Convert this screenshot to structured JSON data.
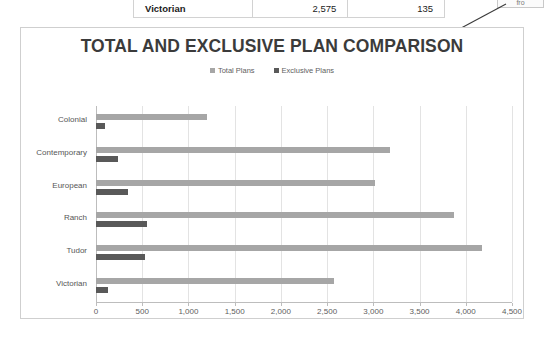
{
  "top_table": {
    "row": {
      "name": "Victorian",
      "total": "2,575",
      "exclusive": "135"
    }
  },
  "callout": {
    "text": "fro"
  },
  "chart_data": {
    "type": "bar",
    "orientation": "horizontal",
    "title": "TOTAL AND EXCLUSIVE PLAN COMPARISON",
    "xlabel": "",
    "ylabel": "",
    "xlim": [
      0,
      4500
    ],
    "xticks": [
      "0",
      "500",
      "1,000",
      "1,500",
      "2,000",
      "2,500",
      "3,000",
      "3,500",
      "4,000",
      "4,500"
    ],
    "xtick_values": [
      0,
      500,
      1000,
      1500,
      2000,
      2500,
      3000,
      3500,
      4000,
      4500
    ],
    "grid": true,
    "legend_position": "top",
    "categories": [
      "Colonial",
      "Contemporary",
      "European",
      "Ranch",
      "Tudor",
      "Victorian"
    ],
    "series": [
      {
        "name": "Total Plans",
        "color": "#a6a6a6",
        "values": [
          1200,
          3175,
          3020,
          3870,
          4175,
          2575
        ]
      },
      {
        "name": "Exclusive Plans",
        "color": "#595959",
        "values": [
          95,
          240,
          350,
          555,
          530,
          135
        ]
      }
    ]
  }
}
